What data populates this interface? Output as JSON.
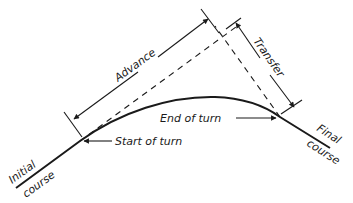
{
  "diagram": {
    "labels": {
      "advance": "Advance",
      "transfer": "Transfer",
      "end_of_turn": "End of turn",
      "start_of_turn": "Start of turn",
      "initial_course_1": "Initial",
      "initial_course_2": "course",
      "final_course_1": "Final",
      "final_course_2": "course"
    },
    "colors": {
      "stroke": "#1a1a1a",
      "background": "#ffffff"
    }
  }
}
